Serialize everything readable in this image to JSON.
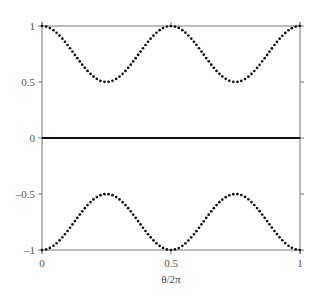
{
  "chart_data": {
    "type": "line",
    "title": "",
    "xlabel": "θ/2π",
    "ylabel": "",
    "xlim": [
      0,
      1
    ],
    "ylim": [
      -1,
      1
    ],
    "grid": false,
    "legend": null,
    "x_ticks": [
      {
        "value": 0,
        "label": "0"
      },
      {
        "value": 0.5,
        "label": "0.5"
      },
      {
        "value": 1,
        "label": "1"
      }
    ],
    "y_ticks": [
      {
        "value": 1,
        "label": "1"
      },
      {
        "value": 0.5,
        "label": "0.5"
      },
      {
        "value": 0,
        "label": "0"
      },
      {
        "value": -0.5,
        "label": "–0.5"
      },
      {
        "value": -1,
        "label": "–1"
      }
    ],
    "series": [
      {
        "name": "upper",
        "style": "dotted",
        "color": "#111111",
        "formula": "0.75 + 0.25*cos(4*pi*x)",
        "x": [
          0,
          0.125,
          0.25,
          0.375,
          0.5,
          0.625,
          0.75,
          0.875,
          1
        ],
        "values": [
          1,
          0.75,
          0.5,
          0.75,
          1,
          0.75,
          0.5,
          0.75,
          1
        ]
      },
      {
        "name": "zero",
        "style": "solid",
        "color": "#111111",
        "formula": "0",
        "x": [
          0,
          1
        ],
        "values": [
          0,
          0
        ]
      },
      {
        "name": "lower",
        "style": "dotted",
        "color": "#111111",
        "formula": "-(0.75 + 0.25*cos(4*pi*x))",
        "x": [
          0,
          0.125,
          0.25,
          0.375,
          0.5,
          0.625,
          0.75,
          0.875,
          1
        ],
        "values": [
          -1,
          -0.75,
          -0.5,
          -0.75,
          -1,
          -0.75,
          -0.5,
          -0.75,
          -1
        ]
      }
    ]
  }
}
